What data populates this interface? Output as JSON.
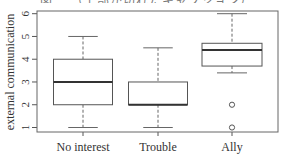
{
  "chart_data": {
    "type": "boxplot",
    "title": "",
    "xlabel": "",
    "ylabel": "external communication",
    "ylim": [
      0.8,
      6.15
    ],
    "yticks": [
      1,
      2,
      3,
      4,
      5,
      6
    ],
    "grid": false,
    "legend": null,
    "categories": [
      "No interest",
      "Trouble",
      "Ally"
    ],
    "series": [
      {
        "name": "No interest",
        "whisker_low": 1,
        "q1": 2,
        "median": 3,
        "q3": 4,
        "whisker_high": 5,
        "outliers": []
      },
      {
        "name": "Trouble",
        "whisker_low": 1,
        "q1": 2,
        "median": 2,
        "q3": 3,
        "whisker_high": 4.5,
        "outliers": []
      },
      {
        "name": "Ally",
        "whisker_low": 3.4,
        "q1": 3.7,
        "median": 4.4,
        "q3": 4.7,
        "whisker_high": 6,
        "outliers": [
          2,
          1
        ]
      }
    ]
  },
  "caption_partial": "図 …（上部が切れたキャプション）",
  "colors": {
    "axis": "#555555",
    "box": "#555555",
    "median": "#333333",
    "whisker": "#666666",
    "text": "#333333"
  }
}
